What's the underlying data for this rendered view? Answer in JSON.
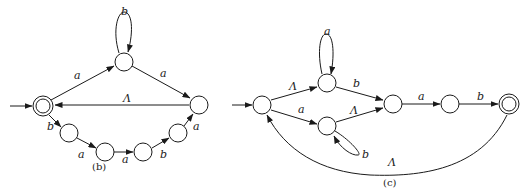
{
  "diagrams": {
    "b": {
      "caption": "(b)",
      "labels": {
        "loop_top": "b",
        "start_to_top": "a",
        "top_to_right": "a",
        "right_to_start": "Λ",
        "start_to_c1": "b",
        "c1_to_c2": "a",
        "c2_to_c3": "a",
        "c3_to_c4": "b",
        "c4_to_right": "a"
      }
    },
    "c": {
      "caption": "(c)",
      "labels": {
        "start_to_top": "Λ",
        "start_to_bottom": "a",
        "loop_top": "a",
        "loop_bottom": "b",
        "top_to_mid": "b",
        "bottom_to_mid": "Λ",
        "mid_to_next": "a",
        "next_to_final": "b",
        "final_to_start": "Λ"
      }
    }
  }
}
